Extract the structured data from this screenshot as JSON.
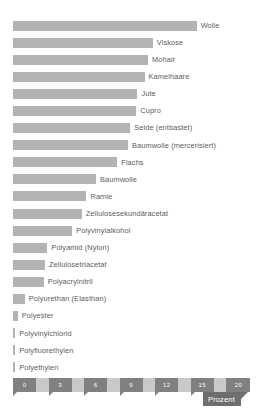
{
  "chart_data": {
    "type": "bar",
    "orientation": "horizontal",
    "title": "",
    "xlabel": "Prozent",
    "ylabel": "",
    "xlim": [
      0,
      20
    ],
    "grid": false,
    "legend": null,
    "tick_labels": [
      "0",
      "3",
      "6",
      "9",
      "12",
      "15",
      "18",
      "20"
    ],
    "tick_values": [
      0,
      3,
      6,
      9,
      12,
      15,
      18,
      20
    ],
    "categories": [
      "Wolle",
      "Viskose",
      "Mohair",
      "Kamelhaare",
      "Jute",
      "Cupro",
      "Seide (entbastet)",
      "Baumwolle (mercerisiert)",
      "Flachs",
      "Baumwolle",
      "Ramie",
      "Zellulosesekundäracetat",
      "Polyvinylalkohol",
      "Polyamid   (Nylon)",
      "Zellulosetriacetat",
      "Polyacrylnitril",
      "Polyurethan (Elasthan)",
      "Polyester",
      "Polyvinylchlorid",
      "Polyfluorethylen",
      "Polyethylen",
      "Polypropylen"
    ],
    "values": [
      15.5,
      11.8,
      11.4,
      11.1,
      10.5,
      10.4,
      9.9,
      9.7,
      8.8,
      7.0,
      6.2,
      5.8,
      5.0,
      2.9,
      2.7,
      2.6,
      1.0,
      0.4,
      0.15,
      0.15,
      0.15,
      0.15
    ],
    "units": "%",
    "bar_color": "#b3b3b3",
    "axis_color": "#c9c9c9",
    "tick_block_color": "#808080",
    "label_color": "#5c5c5c"
  },
  "axis": {
    "unit_tag": "Prozent"
  }
}
